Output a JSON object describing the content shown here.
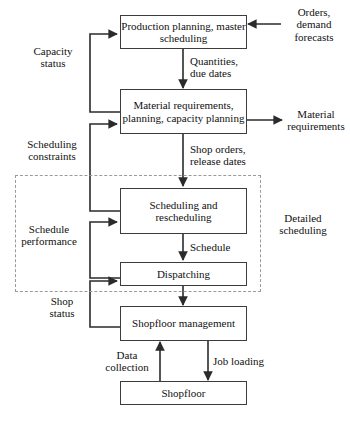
{
  "diagram": {
    "nodes": [
      {
        "id": "production-planning",
        "label": "Production planning,\nmaster scheduling"
      },
      {
        "id": "material-requirements",
        "label": "Material requirements,\nplanning,\ncapacity planning"
      },
      {
        "id": "scheduling-rescheduling",
        "label": "Scheduling\nand\nrescheduling"
      },
      {
        "id": "dispatching",
        "label": "Dispatching"
      },
      {
        "id": "shopfloor-management",
        "label": "Shopfloor\nmanagement"
      },
      {
        "id": "shopfloor",
        "label": "Shopfloor"
      }
    ],
    "edge_labels": [
      {
        "id": "orders-demand-forecasts",
        "label": "Orders,\ndemand\nforecasts"
      },
      {
        "id": "capacity-status",
        "label": "Capacity\nstatus"
      },
      {
        "id": "quantities-due-dates",
        "label": "Quantities,\ndue dates"
      },
      {
        "id": "material-requirements-output",
        "label": "Material\nrequirements"
      },
      {
        "id": "scheduling-constraints",
        "label": "Scheduling\nconstraints"
      },
      {
        "id": "shop-orders-release-dates",
        "label": "Shop orders,\nrelease dates"
      },
      {
        "id": "schedule-performance",
        "label": "Schedule\nperformance"
      },
      {
        "id": "schedule",
        "label": "Schedule"
      },
      {
        "id": "shop-status",
        "label": "Shop\nstatus"
      },
      {
        "id": "data-collection",
        "label": "Data\ncollection"
      },
      {
        "id": "job-loading",
        "label": "Job loading"
      }
    ],
    "groups": [
      {
        "id": "detailed-scheduling",
        "label": "Detailed\nscheduling"
      }
    ],
    "colors": {
      "box_border": "#3c3c3c",
      "connector": "#2b2b2b",
      "group_border": "#9a9a9a",
      "background": "#ffffff",
      "text": "#111111"
    }
  }
}
